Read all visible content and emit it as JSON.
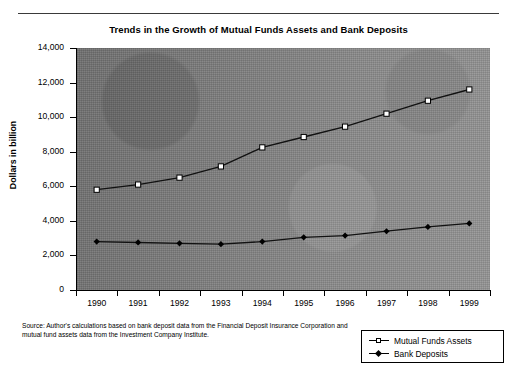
{
  "chart_data": {
    "type": "line",
    "title": "Trends in the Growth of Mutual Funds Assets and Bank Deposits",
    "xlabel": "",
    "ylabel": "Dollars in billion",
    "categories": [
      "1990",
      "1991",
      "1992",
      "1993",
      "1994",
      "1995",
      "1996",
      "1997",
      "1998",
      "1999"
    ],
    "series": [
      {
        "name": "Mutual Funds Assets",
        "marker": "open-square",
        "values": [
          5800,
          6100,
          6500,
          7150,
          8250,
          8850,
          9450,
          10200,
          10950,
          11600
        ]
      },
      {
        "name": "Bank Deposits",
        "marker": "filled-diamond",
        "values": [
          2800,
          2750,
          2700,
          2650,
          2800,
          3050,
          3150,
          3400,
          3650,
          3850
        ]
      }
    ],
    "ylim": [
      0,
      14000
    ],
    "yticks": [
      "0",
      "2,000",
      "4,000",
      "6,000",
      "8,000",
      "10,000",
      "12,000",
      "14,000"
    ],
    "ytick_values": [
      0,
      2000,
      4000,
      6000,
      8000,
      10000,
      12000,
      14000
    ],
    "grid": false,
    "legend_position": "bottom-right",
    "plot_background": "#808080",
    "line_color": "#000000"
  },
  "footer": {
    "source_note": "Source: Author's calculations based on bank deposit data from the Financial Deposit Insurance Corporation and mutual fund assets data from the Investment Company Institute."
  },
  "legend": {
    "items": [
      {
        "label": "Mutual Funds Assets"
      },
      {
        "label": "Bank Deposits"
      }
    ]
  }
}
